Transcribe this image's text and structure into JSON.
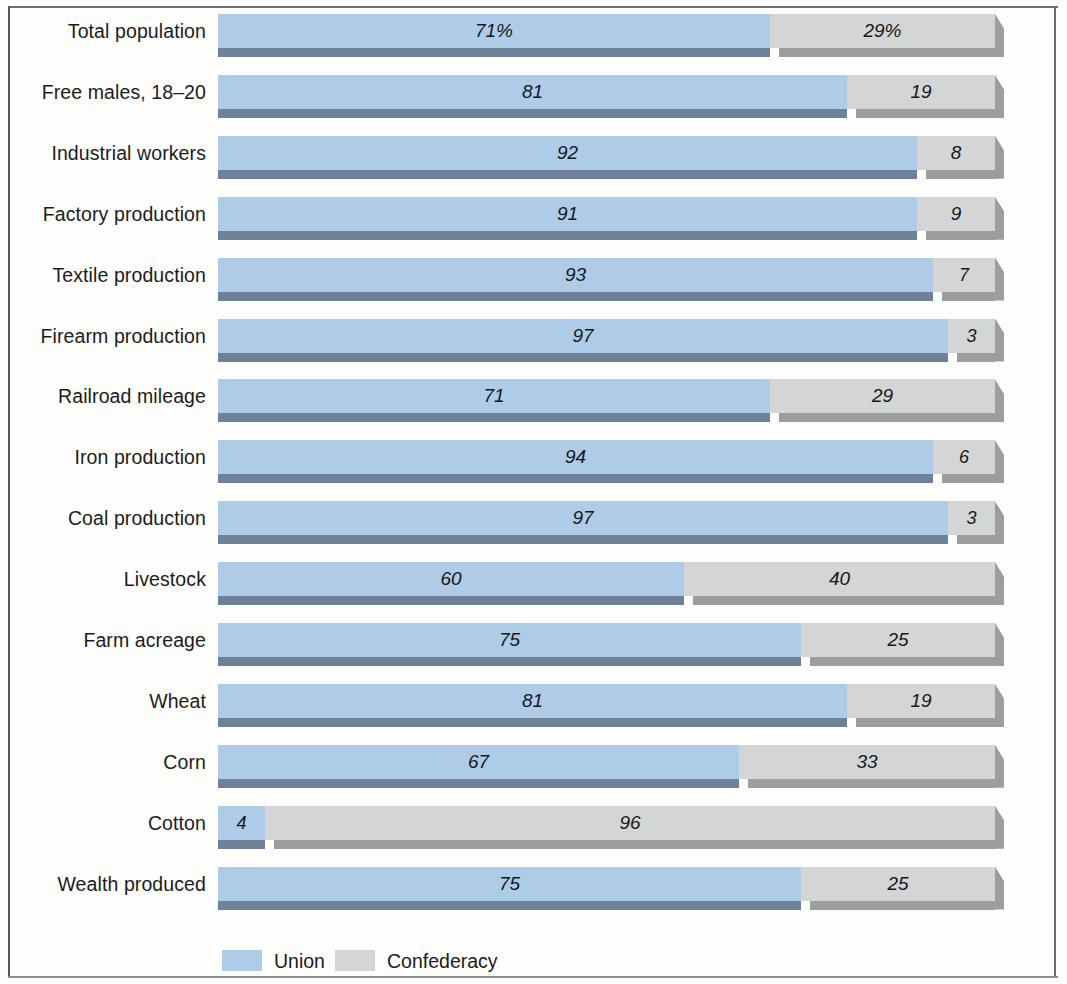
{
  "chart_data": {
    "type": "bar",
    "subtype": "stacked-horizontal-100pct",
    "title": "",
    "xlabel": "",
    "ylabel": "",
    "xlim": [
      0,
      100
    ],
    "grid": false,
    "legend_position": "bottom",
    "units": "percent",
    "categories": [
      "Total population",
      "Free males, 18–20",
      "Industrial workers",
      "Factory production",
      "Textile production",
      "Firearm production",
      "Railroad mileage",
      "Iron production",
      "Coal production",
      "Livestock",
      "Farm acreage",
      "Wheat",
      "Corn",
      "Cotton",
      "Wealth produced"
    ],
    "series": [
      {
        "name": "Union",
        "color": "#aecbe8",
        "values": [
          71,
          81,
          92,
          91,
          93,
          97,
          71,
          94,
          97,
          60,
          75,
          81,
          67,
          4,
          75
        ]
      },
      {
        "name": "Confederacy",
        "color": "#d3d6d4",
        "values": [
          29,
          19,
          8,
          9,
          7,
          3,
          29,
          6,
          3,
          40,
          25,
          19,
          33,
          96,
          25
        ]
      }
    ],
    "data_labels": {
      "Total population": {
        "union": "71%",
        "confederacy": "29%"
      },
      "Free males, 18–20": {
        "union": "81",
        "confederacy": "19"
      },
      "Industrial workers": {
        "union": "92",
        "confederacy": "8"
      },
      "Factory production": {
        "union": "91",
        "confederacy": "9"
      },
      "Textile production": {
        "union": "93",
        "confederacy": "7"
      },
      "Firearm production": {
        "union": "97",
        "confederacy": "3"
      },
      "Railroad mileage": {
        "union": "71",
        "confederacy": "29"
      },
      "Iron production": {
        "union": "94",
        "confederacy": "6"
      },
      "Coal production": {
        "union": "97",
        "confederacy": "3"
      },
      "Livestock": {
        "union": "60",
        "confederacy": "40"
      },
      "Farm acreage": {
        "union": "75",
        "confederacy": "25"
      },
      "Wheat": {
        "union": "81",
        "confederacy": "19"
      },
      "Corn": {
        "union": "67",
        "confederacy": "33"
      },
      "Cotton": {
        "union": "4",
        "confederacy": "96"
      },
      "Wealth produced": {
        "union": "75",
        "confederacy": "25"
      }
    }
  },
  "rows": [
    {
      "label": "Total population",
      "union": 71,
      "confederacy": 29,
      "union_label": "71%",
      "conf_label": "29%",
      "union_draw": 71,
      "show_union_label": true,
      "show_conf_label": true
    },
    {
      "label": "Free males, 18–20",
      "union": 81,
      "confederacy": 19,
      "union_label": "81",
      "conf_label": "19",
      "union_draw": 81,
      "show_union_label": true,
      "show_conf_label": true
    },
    {
      "label": "Industrial workers",
      "union": 92,
      "confederacy": 8,
      "union_label": "92",
      "conf_label": "8",
      "union_draw": 90,
      "show_union_label": true,
      "show_conf_label": true
    },
    {
      "label": "Factory production",
      "union": 91,
      "confederacy": 9,
      "union_label": "91",
      "conf_label": "9",
      "union_draw": 90,
      "show_union_label": true,
      "show_conf_label": true
    },
    {
      "label": "Textile production",
      "union": 93,
      "confederacy": 7,
      "union_label": "93",
      "conf_label": "7",
      "union_draw": 92,
      "show_union_label": true,
      "show_conf_label": true
    },
    {
      "label": "Firearm production",
      "union": 97,
      "confederacy": 3,
      "union_label": "97",
      "conf_label": "3",
      "union_draw": 94,
      "show_union_label": true,
      "show_conf_label": true
    },
    {
      "label": "Railroad mileage",
      "union": 71,
      "confederacy": 29,
      "union_label": "71",
      "conf_label": "29",
      "union_draw": 71,
      "show_union_label": true,
      "show_conf_label": true
    },
    {
      "label": "Iron production",
      "union": 94,
      "confederacy": 6,
      "union_label": "94",
      "conf_label": "6",
      "union_draw": 92,
      "show_union_label": true,
      "show_conf_label": true
    },
    {
      "label": "Coal production",
      "union": 97,
      "confederacy": 3,
      "union_label": "97",
      "conf_label": "3",
      "union_draw": 94,
      "show_union_label": true,
      "show_conf_label": true
    },
    {
      "label": "Livestock",
      "union": 60,
      "confederacy": 40,
      "union_label": "60",
      "conf_label": "40",
      "union_draw": 60,
      "show_union_label": true,
      "show_conf_label": true
    },
    {
      "label": "Farm acreage",
      "union": 75,
      "confederacy": 25,
      "union_label": "75",
      "conf_label": "25",
      "union_draw": 75,
      "show_union_label": true,
      "show_conf_label": true
    },
    {
      "label": "Wheat",
      "union": 81,
      "confederacy": 19,
      "union_label": "81",
      "conf_label": "19",
      "union_draw": 81,
      "show_union_label": true,
      "show_conf_label": true
    },
    {
      "label": "Corn",
      "union": 67,
      "confederacy": 33,
      "union_label": "67",
      "conf_label": "33",
      "union_draw": 67,
      "show_union_label": true,
      "show_conf_label": true
    },
    {
      "label": "Cotton",
      "union": 4,
      "confederacy": 96,
      "union_label": "4",
      "conf_label": "96",
      "union_draw": 6,
      "show_union_label": true,
      "show_conf_label": true
    },
    {
      "label": "Wealth produced",
      "union": 75,
      "confederacy": 25,
      "union_label": "75",
      "conf_label": "25",
      "union_draw": 75,
      "show_union_label": true,
      "show_conf_label": true
    }
  ],
  "legend": {
    "union_label": "Union",
    "confederacy_label": "Confederacy"
  },
  "colors": {
    "union_face": "#aecbe8",
    "union_bevel": "#6e8199",
    "confederacy_face": "#d3d6d4",
    "confederacy_bevel": "#9a9e9c",
    "text": "#1c1c1c",
    "frame": "#5a5e60",
    "background": "#fdfdfc"
  }
}
